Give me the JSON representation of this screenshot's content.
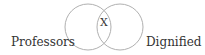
{
  "diagram": {
    "type": "venn",
    "sets": [
      {
        "label": "Professors",
        "position": "left"
      },
      {
        "label": "Dignified",
        "position": "right"
      }
    ],
    "intersection_label": "X",
    "colors": {
      "stroke": "#b0b0b0",
      "text": "#333333"
    }
  }
}
